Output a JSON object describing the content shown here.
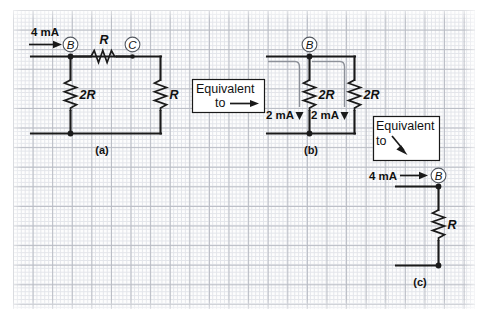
{
  "figure": {
    "background": "graph-paper",
    "grid_major_color": "#b9bcc4",
    "grid_minor_color": "#e3e5ea",
    "ink_color": "#1a1a1a",
    "leader_color": "#8d9199"
  },
  "panels": [
    {
      "id": "a",
      "caption": "(a)",
      "source_current": "4 mA",
      "nodes": [
        "B",
        "C"
      ],
      "resistors": [
        "R",
        "2R",
        "R"
      ]
    },
    {
      "id": "b",
      "caption": "(b)",
      "nodes": [
        "B"
      ],
      "resistors": [
        "2R",
        "2R"
      ],
      "branch_currents": [
        "2 mA",
        "2 mA"
      ]
    },
    {
      "id": "c",
      "caption": "(c)",
      "source_current": "4 mA",
      "nodes": [
        "B"
      ],
      "resistors": [
        "R"
      ]
    }
  ],
  "panel_a": {
    "current_label": "4 mA",
    "node_b": "B",
    "node_c": "C",
    "series_resistor": "R",
    "left_resistor": "2R",
    "right_resistor": "R",
    "caption": "(a)"
  },
  "panel_b": {
    "node_b": "B",
    "left_resistor": "2R",
    "right_resistor": "2R",
    "left_current": "2 mA",
    "right_current": "2 mA",
    "caption": "(b)"
  },
  "panel_c": {
    "current_label": "4 mA",
    "node_b": "B",
    "resistor": "R",
    "caption": "(c)"
  },
  "equivalence_box_1": {
    "line1": "Equivalent",
    "line2": "to",
    "arrow": "right-arrow"
  },
  "equivalence_box_2": {
    "line1": "Equivalent",
    "line2": "to",
    "arrow": "diagonal-down-right-arrow"
  }
}
